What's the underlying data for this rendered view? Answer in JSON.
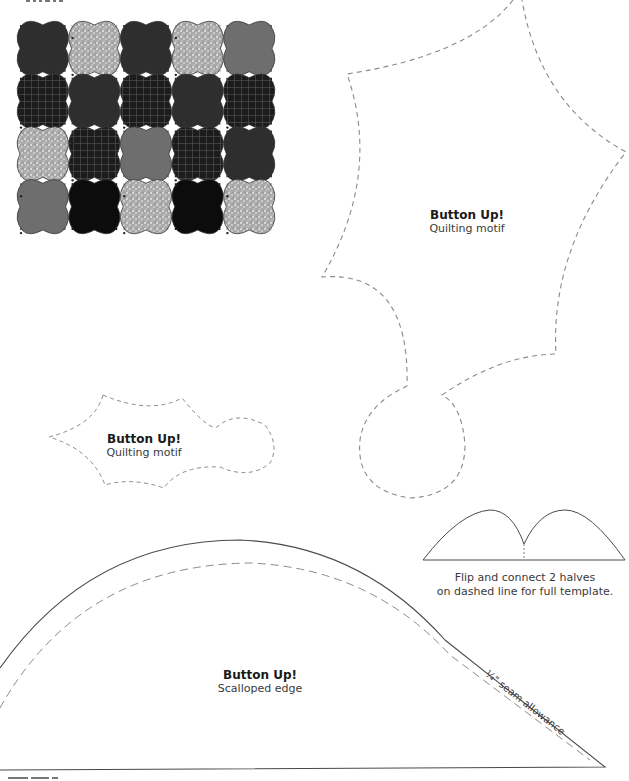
{
  "page": {
    "background": "#ffffff",
    "line_color": "#4a4a4a",
    "dash_color": "#8a8a8a"
  },
  "quilt_thumbnail": {
    "rows": 4,
    "cols": 5,
    "blocks": [
      [
        "dark",
        "speckle",
        "dark",
        "speckle",
        "medium"
      ],
      [
        "plaid",
        "dark",
        "plaid",
        "dark",
        "plaid"
      ],
      [
        "speckle",
        "plaid",
        "medium",
        "plaid",
        "dark"
      ],
      [
        "medium",
        "black",
        "speckle",
        "black",
        "speckle"
      ]
    ],
    "fills": {
      "dark": "#2e2e2e",
      "speckle": "#b8b8b8",
      "medium": "#6e6e6e",
      "plaid": "#1e1e1e",
      "black": "#0c0c0c"
    }
  },
  "templates": {
    "large_motif": {
      "title": "Button Up!",
      "subtitle": "Quilting motif"
    },
    "small_motif": {
      "title": "Button Up!",
      "subtitle": "Quilting motif"
    },
    "scalloped_edge": {
      "title": "Button Up!",
      "subtitle": "Scalloped edge",
      "seam_label": "¼\" seam allowance"
    },
    "half_template_note": {
      "line1": "Flip and connect 2 halves",
      "line2": "on dashed line for full template."
    }
  }
}
